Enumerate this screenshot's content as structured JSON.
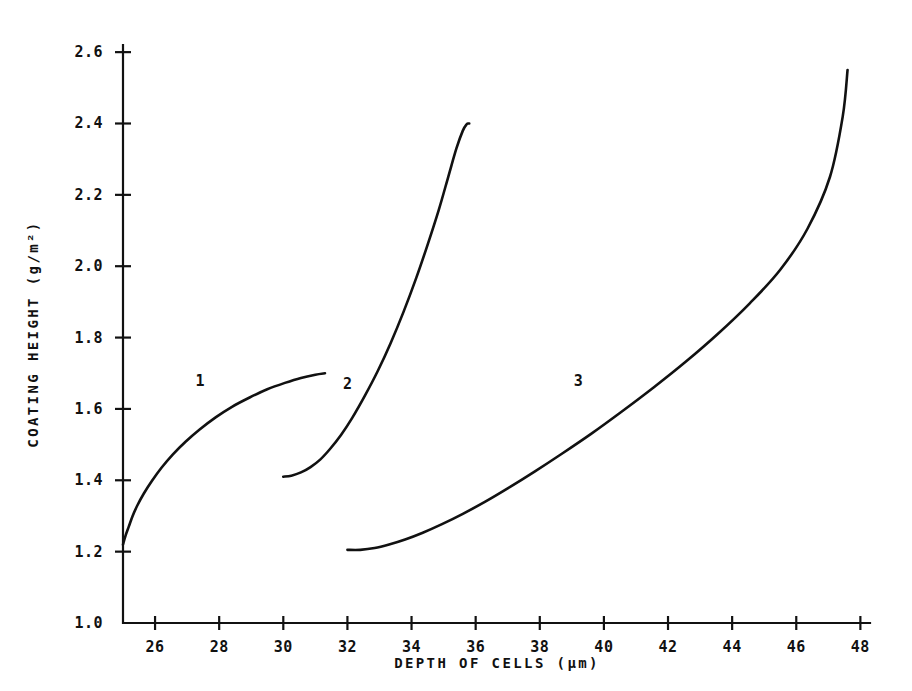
{
  "chart_data": {
    "type": "line",
    "title": "",
    "xlabel": "DEPTH OF CELLS (µm)",
    "ylabel": "COATING HEIGHT (g/m²)",
    "xlim": [
      25.0,
      48.3
    ],
    "ylim": [
      1.0,
      2.62
    ],
    "xticks": [
      26,
      28,
      30,
      32,
      34,
      36,
      38,
      40,
      42,
      44,
      46,
      48
    ],
    "xtick_labels": [
      "26",
      "28",
      "30",
      "32",
      "34",
      "36",
      "38",
      "40",
      "42",
      "44",
      "46",
      "48"
    ],
    "yticks": [
      1.0,
      1.2,
      1.4,
      1.6,
      1.8,
      2.0,
      2.2,
      2.4,
      2.6
    ],
    "ytick_labels": [
      "1.0",
      "1.2",
      "1.4",
      "1.6",
      "1.8",
      "2.0",
      "2.2",
      "2.4",
      "2.6"
    ],
    "grid": false,
    "legend": "inline-curve-labels",
    "series": [
      {
        "name": "1",
        "label": "1",
        "label_x": 27.4,
        "label_y": 1.665,
        "color": "#111111",
        "x": [
          25.0,
          25.08,
          25.18,
          25.3,
          25.45,
          25.65,
          25.9,
          26.2,
          26.55,
          26.95,
          27.4,
          27.9,
          28.4,
          28.95,
          29.5,
          30.05,
          30.55,
          31.0,
          31.3
        ],
        "y": [
          1.22,
          1.245,
          1.27,
          1.3,
          1.33,
          1.363,
          1.398,
          1.435,
          1.472,
          1.508,
          1.543,
          1.577,
          1.606,
          1.632,
          1.655,
          1.673,
          1.687,
          1.696,
          1.7
        ]
      },
      {
        "name": "2",
        "label": "2",
        "label_x": 32.0,
        "label_y": 1.655,
        "color": "#111111",
        "x": [
          30.0,
          30.25,
          30.55,
          30.85,
          31.15,
          31.45,
          31.8,
          32.15,
          32.55,
          32.95,
          33.35,
          33.75,
          34.15,
          34.5,
          34.85,
          35.15,
          35.4,
          35.6,
          35.72,
          35.78,
          35.8
        ],
        "y": [
          1.41,
          1.413,
          1.422,
          1.437,
          1.458,
          1.487,
          1.527,
          1.575,
          1.638,
          1.707,
          1.785,
          1.872,
          1.968,
          2.06,
          2.158,
          2.252,
          2.33,
          2.38,
          2.398,
          2.4,
          2.4
        ]
      },
      {
        "name": "3",
        "label": "3",
        "label_x": 39.2,
        "label_y": 1.665,
        "color": "#111111",
        "x": [
          32.0,
          32.4,
          32.85,
          33.3,
          33.8,
          34.35,
          34.95,
          35.6,
          36.3,
          37.05,
          37.85,
          38.7,
          39.6,
          40.55,
          41.55,
          42.55,
          43.55,
          44.55,
          45.5,
          46.35,
          47.05,
          47.45,
          47.6
        ],
        "y": [
          1.205,
          1.205,
          1.21,
          1.22,
          1.234,
          1.253,
          1.277,
          1.306,
          1.34,
          1.38,
          1.425,
          1.475,
          1.53,
          1.592,
          1.66,
          1.732,
          1.81,
          1.896,
          1.99,
          2.105,
          2.25,
          2.42,
          2.55
        ]
      }
    ]
  },
  "axes_geometry": {
    "plot_left_px": 123,
    "plot_right_px": 870,
    "plot_bottom_px": 623,
    "plot_top_px": 45
  }
}
